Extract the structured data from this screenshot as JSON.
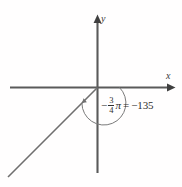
{
  "figure": {
    "background_color": "#fffefe",
    "axis_color": "#5a5a5a",
    "ray_color": "#6b6b6b",
    "arc_color": "#6b6b6b",
    "text_color": "#2e2e2e"
  },
  "axes": {
    "x_label": "x",
    "y_label": "y",
    "origin": {
      "x": 97,
      "y": 87
    }
  },
  "angle": {
    "radian_sign": "−",
    "numerator": "3",
    "denominator": "4",
    "pi_symbol": "π",
    "equals": "=",
    "degrees": "−135",
    "full_text": "− 3/4 π = −135",
    "direction": "clockwise",
    "terminal_side_degrees": -135,
    "arc_start_degrees": 0,
    "arc_end_degrees": -135
  },
  "icons": {
    "x_axis_arrow": "arrow-right-icon",
    "y_axis_arrow": "arrow-up-icon",
    "angle_arc_arrow": "arc-arrow-icon"
  }
}
